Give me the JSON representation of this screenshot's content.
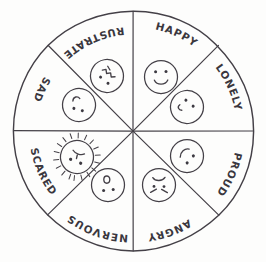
{
  "figure": {
    "style": "hand-drawn pencil sketch",
    "background_color": "#fdfdfc",
    "ink_color": "#444047"
  },
  "wheel": {
    "center_x": 133,
    "center_y": 131,
    "radius": 120,
    "segment_count": 8,
    "segments": [
      {
        "id": "happy",
        "label": "HAPPY",
        "position": "top-right",
        "start_angle_deg": -90,
        "end_angle_deg": -45,
        "label_orientation": "arc-clockwise",
        "face": {
          "name": "happy-face",
          "expression": "smiling",
          "mouth": "upward-curve-smile",
          "eyes": "two-dots",
          "cx": 161,
          "cy": 77,
          "r": 17,
          "rotation_deg": 0
        }
      },
      {
        "id": "lonely",
        "label": "LONELY",
        "position": "right-upper",
        "start_angle_deg": -45,
        "end_angle_deg": 0,
        "label_orientation": "arc-clockwise",
        "face": {
          "name": "lonely-face",
          "expression": "downcast",
          "mouth": "small-flat-left",
          "eyes": "two-dots-tilted",
          "cx": 187,
          "cy": 107,
          "r": 17,
          "rotation_deg": 35
        }
      },
      {
        "id": "proud",
        "label": "PROUD",
        "position": "right-lower",
        "start_angle_deg": 0,
        "end_angle_deg": 45,
        "label_orientation": "arc-clockwise",
        "face": {
          "name": "proud-face",
          "expression": "content-grin",
          "mouth": "small-curve",
          "eyes": "two-dots-tilted",
          "cx": 187,
          "cy": 156,
          "r": 17,
          "rotation_deg": 135
        }
      },
      {
        "id": "angry",
        "label": "ANGRY",
        "position": "bottom-right",
        "start_angle_deg": 45,
        "end_angle_deg": 90,
        "label_orientation": "arc-clockwise-inverted",
        "face": {
          "name": "angry-face",
          "expression": "scowling",
          "mouth": "downturned-frown",
          "eyes": "two-slanted-brows",
          "cx": 159,
          "cy": 185,
          "r": 17,
          "rotation_deg": 180
        }
      },
      {
        "id": "nervous",
        "label": "NERVOUS",
        "position": "bottom-left",
        "start_angle_deg": 90,
        "end_angle_deg": 135,
        "label_orientation": "arc-clockwise-inverted",
        "face": {
          "name": "nervous-face",
          "expression": "worried-open-mouth",
          "mouth": "small-open-oval",
          "eyes": "two-dots",
          "cx": 108,
          "cy": 185,
          "r": 17,
          "rotation_deg": 180
        }
      },
      {
        "id": "scared",
        "label": "SCARED",
        "position": "left-lower",
        "start_angle_deg": 135,
        "end_angle_deg": 180,
        "label_orientation": "arc-clockwise-inverted",
        "face": {
          "name": "scared-face",
          "expression": "startled-with-radiating-lines",
          "mouth": "small-grimace",
          "eyes": "two-dots-wide",
          "cx": 77,
          "cy": 157,
          "r": 17,
          "rotation_deg": 200,
          "has_radiating_lines": true
        }
      },
      {
        "id": "sad",
        "label": "SAD",
        "position": "left-upper",
        "start_angle_deg": 180,
        "end_angle_deg": 225,
        "label_orientation": "arc-clockwise",
        "face": {
          "name": "sad-face",
          "expression": "frowning",
          "mouth": "downward-curve-frown",
          "eyes": "two-dots",
          "cx": 79,
          "cy": 105,
          "r": 17,
          "rotation_deg": 205
        }
      },
      {
        "id": "frustrated",
        "label": "FRUSTRATED",
        "position": "top-left",
        "start_angle_deg": 225,
        "end_angle_deg": 270,
        "label_orientation": "arc-clockwise",
        "face": {
          "name": "frustrated-face",
          "expression": "squiggly-mouth",
          "mouth": "wavy-zigzag",
          "eyes": "two-dots",
          "cx": 107,
          "cy": 76,
          "r": 17,
          "rotation_deg": 215
        }
      }
    ]
  }
}
